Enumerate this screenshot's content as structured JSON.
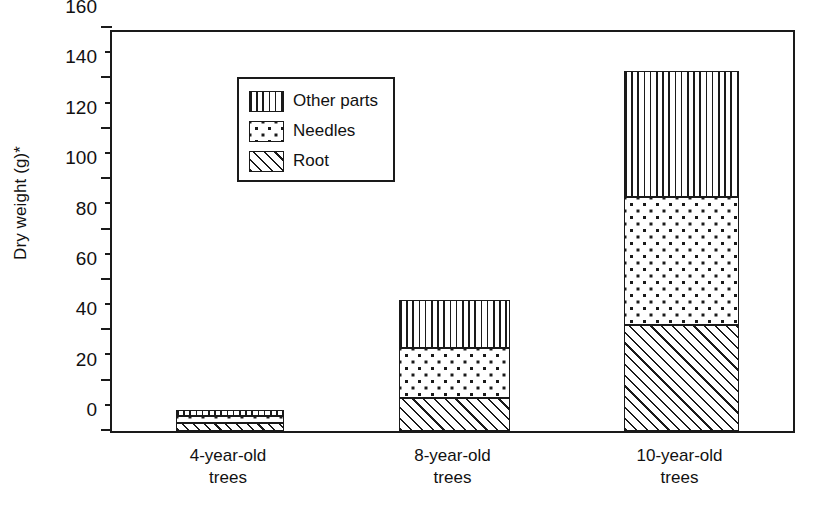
{
  "chart_data": {
    "type": "bar",
    "stacked": true,
    "title": "",
    "xlabel": "",
    "ylabel": "Dry weight (g)*",
    "ylim": [
      0,
      160
    ],
    "ytick_step": 20,
    "yminor_step": 10,
    "grid": false,
    "legend_position": "top-left inside",
    "categories": [
      "4-year-old\ntrees",
      "8-year-old\ntrees",
      "10-year-old\ntrees"
    ],
    "category_lines": [
      [
        "4-year-old",
        "trees"
      ],
      [
        "8-year-old",
        "trees"
      ],
      [
        "10-year-old",
        "trees"
      ]
    ],
    "ytick_labels": [
      "0",
      "20",
      "40",
      "60",
      "80",
      "100",
      "120",
      "140",
      "160"
    ],
    "ytick_values": [
      0,
      20,
      40,
      60,
      80,
      100,
      120,
      140,
      160
    ],
    "series": [
      {
        "name": "Root",
        "pattern": "diagonal-hatch",
        "values": [
          3,
          13,
          42
        ]
      },
      {
        "name": "Needles",
        "pattern": "dots",
        "values": [
          3,
          20,
          51
        ]
      },
      {
        "name": "Other parts",
        "pattern": "vertical-lines",
        "values": [
          2.5,
          19,
          50
        ]
      }
    ],
    "totals": [
      8.5,
      52,
      143
    ],
    "color": "#1a1a1a",
    "background": "#ffffff"
  },
  "legend": {
    "items": [
      {
        "label": "Other parts",
        "pattern": "vertical-lines"
      },
      {
        "label": "Needles",
        "pattern": "dots"
      },
      {
        "label": "Root",
        "pattern": "diagonal-hatch"
      }
    ]
  },
  "axes": {
    "y_title": "Dry weight (g)*"
  }
}
